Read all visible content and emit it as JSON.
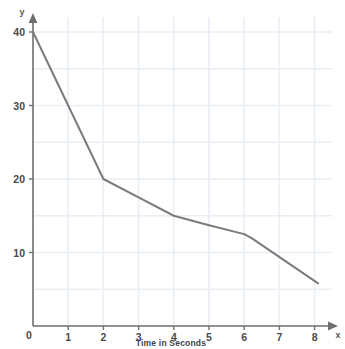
{
  "chart_data": {
    "type": "line",
    "title": "",
    "xlabel": "Time in Seconds",
    "ylabel": "y",
    "x_axis_name": "x",
    "y_axis_name": "y",
    "xlim": [
      0,
      8.4
    ],
    "ylim": [
      0,
      42
    ],
    "grid": true,
    "legend": null,
    "x_ticks": [
      "0",
      "1",
      "2",
      "3",
      "4",
      "5",
      "6",
      "7",
      "8"
    ],
    "x_tick_values": [
      0,
      1,
      2,
      3,
      4,
      5,
      6,
      7,
      8
    ],
    "y_ticks": [
      "10",
      "20",
      "30",
      "40"
    ],
    "y_tick_values": [
      10,
      20,
      30,
      40
    ],
    "series": [
      {
        "name": "decay",
        "color": "#7b7b7b",
        "x": [
          0,
          2,
          3,
          4,
          5,
          6,
          6.2,
          8.1
        ],
        "values": [
          40,
          20,
          17.5,
          15,
          13.7,
          12.5,
          12,
          5.8
        ]
      }
    ]
  },
  "axis": {
    "origin_label": "0",
    "x_name": "x",
    "y_name": "y",
    "x_title": "Time in Seconds"
  },
  "colors": {
    "line": "#7b7b7b",
    "axis": "#6e6e6e",
    "grid": "#e9eef5",
    "background": "#ffffff",
    "text": "#3f3f3f"
  }
}
